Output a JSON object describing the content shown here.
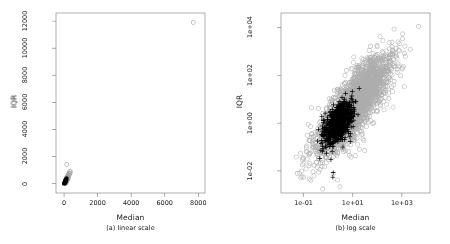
{
  "figure": {
    "background": "#ffffff",
    "axis_color": "#7a7a7a",
    "text_color": "#1a1a1a",
    "width": 450,
    "height": 244
  },
  "chart_data": [
    {
      "type": "scatter",
      "panel_id": "a",
      "title": "",
      "caption": "(a) linear scale",
      "xlabel": "Median",
      "ylabel": "IQR",
      "xscale": "linear",
      "yscale": "linear",
      "xlim": [
        -480,
        8400
      ],
      "ylim": [
        -700,
        12600
      ],
      "xticks": [
        0,
        2000,
        4000,
        6000,
        8000
      ],
      "xticklabels": [
        "0",
        "2000",
        "4000",
        "6000",
        "8000"
      ],
      "yticks": [
        0,
        2000,
        4000,
        6000,
        8000,
        10000,
        12000
      ],
      "yticklabels": [
        "0",
        "2000",
        "4000",
        "6000",
        "8000",
        "10000",
        "12000"
      ],
      "grid": false,
      "legend": "none",
      "series": [
        {
          "name": "group-gray-open-circles",
          "marker": "open-circle",
          "color": "#9a9a9a",
          "size": 2.0,
          "points": [
            [
              7700,
              11900
            ],
            [
              160,
              1420
            ],
            [
              330,
              900
            ],
            [
              395,
              860
            ],
            [
              300,
              780
            ],
            [
              355,
              745
            ],
            [
              270,
              700
            ],
            [
              230,
              640
            ],
            [
              310,
              620
            ],
            [
              205,
              560
            ],
            [
              265,
              520
            ],
            [
              180,
              495
            ],
            [
              150,
              455
            ],
            [
              215,
              430
            ],
            [
              255,
              405
            ],
            [
              120,
              380
            ],
            [
              175,
              360
            ],
            [
              140,
              335
            ],
            [
              195,
              310
            ],
            [
              235,
              295
            ],
            [
              105,
              270
            ],
            [
              160,
              255
            ],
            [
              125,
              235
            ],
            [
              185,
              220
            ],
            [
              95,
              200
            ],
            [
              145,
              190
            ],
            [
              110,
              175
            ],
            [
              170,
              165
            ],
            [
              85,
              150
            ],
            [
              130,
              140
            ],
            [
              100,
              128
            ],
            [
              155,
              120
            ],
            [
              75,
              108
            ],
            [
              118,
              100
            ],
            [
              90,
              92
            ],
            [
              138,
              85
            ],
            [
              65,
              78
            ],
            [
              105,
              70
            ],
            [
              80,
              64
            ],
            [
              122,
              58
            ],
            [
              55,
              52
            ],
            [
              95,
              46
            ],
            [
              70,
              40
            ],
            [
              112,
              35
            ],
            [
              48,
              30
            ],
            [
              86,
              26
            ],
            [
              62,
              22
            ],
            [
              102,
              18
            ],
            [
              40,
              15
            ],
            [
              78,
              12
            ],
            [
              56,
              9
            ],
            [
              92,
              7
            ],
            [
              34,
              5
            ],
            [
              70,
              4
            ],
            [
              50,
              3
            ],
            [
              84,
              2
            ]
          ]
        },
        {
          "name": "group-black-filled",
          "marker": "filled-circle",
          "color": "#000000",
          "size": 2.0,
          "points": [
            [
              60,
              220
            ],
            [
              95,
              290
            ],
            [
              130,
              330
            ],
            [
              150,
              380
            ],
            [
              72,
              180
            ],
            [
              110,
              240
            ],
            [
              88,
              200
            ],
            [
              140,
              300
            ],
            [
              55,
              150
            ],
            [
              100,
              175
            ],
            [
              78,
              140
            ],
            [
              120,
              210
            ],
            [
              45,
              120
            ],
            [
              85,
              130
            ],
            [
              65,
              110
            ],
            [
              108,
              155
            ],
            [
              38,
              95
            ],
            [
              72,
              100
            ],
            [
              52,
              85
            ],
            [
              95,
              115
            ],
            [
              30,
              72
            ],
            [
              62,
              78
            ],
            [
              44,
              62
            ],
            [
              82,
              88
            ],
            [
              25,
              55
            ],
            [
              52,
              58
            ],
            [
              36,
              46
            ],
            [
              70,
              66
            ],
            [
              20,
              42
            ],
            [
              44,
              44
            ],
            [
              30,
              34
            ],
            [
              60,
              50
            ],
            [
              16,
              32
            ],
            [
              36,
              33
            ],
            [
              24,
              25
            ],
            [
              50,
              38
            ],
            [
              13,
              24
            ],
            [
              30,
              25
            ],
            [
              19,
              19
            ],
            [
              42,
              28
            ],
            [
              10,
              18
            ],
            [
              25,
              18
            ],
            [
              15,
              14
            ],
            [
              35,
              21
            ],
            [
              8,
              13
            ],
            [
              20,
              13
            ],
            [
              12,
              10
            ],
            [
              29,
              16
            ],
            [
              6,
              9
            ],
            [
              16,
              10
            ],
            [
              9,
              7
            ],
            [
              24,
              12
            ],
            [
              5,
              7
            ],
            [
              13,
              7
            ],
            [
              7,
              5
            ],
            [
              20,
              9
            ],
            [
              4,
              5
            ],
            [
              10,
              5
            ],
            [
              6,
              4
            ],
            [
              16,
              6
            ],
            [
              3,
              3
            ],
            [
              8,
              4
            ],
            [
              5,
              3
            ],
            [
              13,
              5
            ],
            [
              2,
              2
            ],
            [
              6,
              2
            ],
            [
              4,
              2
            ],
            [
              10,
              3
            ]
          ]
        }
      ]
    },
    {
      "type": "scatter",
      "panel_id": "b",
      "title": "",
      "caption": "(b) log scale",
      "xlabel": "Median",
      "ylabel": "IQR",
      "xscale": "log",
      "yscale": "log",
      "xlim": [
        0.012,
        14000
      ],
      "ylim": [
        0.0012,
        40000
      ],
      "xticks": [
        0.1,
        10,
        1000
      ],
      "xticklabels": [
        "1e-01",
        "1e+01",
        "1e+03"
      ],
      "yticks": [
        0.01,
        1,
        100,
        10000
      ],
      "yticklabels": [
        "1e-02",
        "1e+00",
        "1e+02",
        "1e+04"
      ],
      "grid": false,
      "legend": "none",
      "cloud_gray": {
        "name": "group-gray-open-circles",
        "marker": "open-circle",
        "color": "#adadad",
        "size": 2.1,
        "n": 2600,
        "center_log": [
          1.05,
          0.75
        ],
        "spread_log": [
          0.72,
          1.02
        ],
        "correlation": 0.8,
        "outliers": [
          [
            4800,
            11000
          ],
          [
            0.055,
            0.008
          ],
          [
            0.05,
            0.038
          ],
          [
            0.075,
            0.055
          ],
          [
            0.09,
            0.018
          ],
          [
            3.0,
            0.0022
          ],
          [
            1.6,
            0.0075
          ],
          [
            2.4,
            0.0042
          ],
          [
            700,
            300
          ],
          [
            1400,
            620
          ],
          [
            260,
            190
          ],
          [
            900,
            95
          ]
        ]
      },
      "cloud_black": {
        "name": "group-black-plus",
        "marker": "plus",
        "color": "#000000",
        "size": 2.3,
        "n": 900,
        "center_log": [
          0.42,
          0.02
        ],
        "spread_log": [
          0.3,
          0.42
        ],
        "correlation": 0.55,
        "outliers": [
          [
            1.55,
            0.0055
          ],
          [
            1.6,
            0.0085
          ],
          [
            1.3,
            0.03
          ],
          [
            0.85,
            0.055
          ],
          [
            0.55,
            1.9
          ],
          [
            0.4,
            0.55
          ],
          [
            9.5,
            9.5
          ],
          [
            4.0,
            0.1
          ],
          [
            0.75,
            2.6
          ]
        ]
      }
    }
  ]
}
